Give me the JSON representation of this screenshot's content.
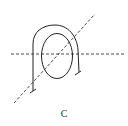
{
  "figure": {
    "label": "C",
    "stroke_color": "#222222",
    "dash_color": "#333333"
  }
}
